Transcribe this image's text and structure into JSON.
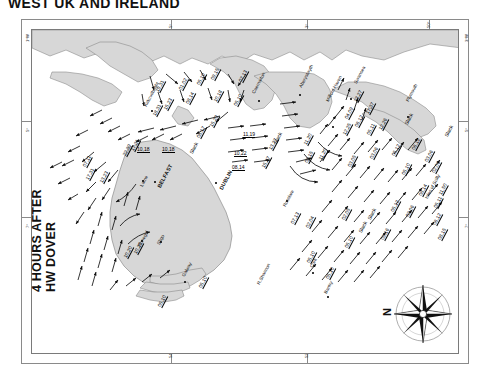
{
  "title": "WEST UK AND IRELAND",
  "caption_line1": "4 HOURS AFTER",
  "caption_line2": "HW DOVER",
  "compass": {
    "north_label": "N",
    "name": "compass-rose"
  },
  "frame": {
    "top_degrees": [
      "5°",
      "3°",
      "50°"
    ],
    "bottom_degrees": [
      "54°",
      "52°",
      "50°"
    ],
    "left_degrees": [
      "1°W",
      "5°",
      "7°",
      "4°"
    ],
    "right_degrees": [
      "3°W",
      "5°",
      "7°",
      "4°"
    ]
  },
  "places": [
    {
      "name": "Kirkcudbright",
      "x": 111,
      "y": 75,
      "rot": -62,
      "cap": false,
      "dot": [
        119,
        80
      ]
    },
    {
      "name": "Caernarfon",
      "x": 219,
      "y": 62,
      "rot": -62,
      "cap": false,
      "dot": [
        226,
        70
      ]
    },
    {
      "name": "Aberystwyth",
      "x": 266,
      "y": 56,
      "rot": -62,
      "cap": false,
      "dot": [
        267,
        64
      ]
    },
    {
      "name": "Milford Haven",
      "x": 293,
      "y": 70,
      "rot": -62,
      "cap": false,
      "dot": [
        300,
        96
      ]
    },
    {
      "name": "Swansea",
      "x": 321,
      "y": 52,
      "rot": -62,
      "cap": false,
      "dot": [
        318,
        68
      ]
    },
    {
      "name": "Plymouth",
      "x": 373,
      "y": 70,
      "rot": -62,
      "cap": false,
      "dot": [
        375,
        86
      ]
    },
    {
      "name": "Larne",
      "x": 107,
      "y": 155,
      "rot": -62,
      "cap": false,
      "dot": [
        110,
        150
      ]
    },
    {
      "name": "BELFAST",
      "x": 124,
      "y": 156,
      "rot": -62,
      "cap": true,
      "dot": [
        122,
        151
      ]
    },
    {
      "name": "DUBLIN",
      "x": 186,
      "y": 158,
      "rot": -62,
      "cap": true,
      "dot": [
        183,
        152
      ]
    },
    {
      "name": "Rosslare",
      "x": 250,
      "y": 175,
      "rot": -62,
      "cap": false,
      "dot": [
        254,
        170
      ]
    },
    {
      "name": "Donegal",
      "x": 105,
      "y": 215,
      "rot": -62,
      "cap": false,
      "dot": [
        109,
        210
      ]
    },
    {
      "name": "Sligo",
      "x": 124,
      "y": 213,
      "rot": -62,
      "cap": false,
      "dot": [
        128,
        211
      ]
    },
    {
      "name": "Galway",
      "x": 149,
      "y": 245,
      "rot": -62,
      "cap": false,
      "dot": [
        152,
        251
      ]
    },
    {
      "name": "R.Shannon",
      "x": 224,
      "y": 253,
      "rot": -62,
      "cap": false,
      "dot": null
    },
    {
      "name": "Cork",
      "x": 277,
      "y": 236,
      "rot": -62,
      "cap": false,
      "dot": [
        280,
        242
      ]
    },
    {
      "name": "Bantry",
      "x": 291,
      "y": 262,
      "rot": -62,
      "cap": false,
      "dot": [
        295,
        266
      ]
    },
    {
      "name": "Isles of Scilly",
      "x": 392,
      "y": 167,
      "rot": -62,
      "cap": false,
      "dot": null
    }
  ],
  "rates": [
    {
      "v": "19,31",
      "x": 122,
      "y": 60,
      "rot": -62
    },
    {
      "v": "01,02",
      "x": 145,
      "y": 58,
      "rot": -62
    },
    {
      "v": "05,10",
      "x": 163,
      "y": 53,
      "rot": -62
    },
    {
      "v": "09,15",
      "x": 177,
      "y": 48,
      "rot": -62
    },
    {
      "v": "07,13",
      "x": 205,
      "y": 50,
      "rot": -62
    },
    {
      "v": "18,31",
      "x": 119,
      "y": 84,
      "rot": -62
    },
    {
      "v": "15,23",
      "x": 130,
      "y": 78,
      "rot": -62
    },
    {
      "v": "08,14",
      "x": 152,
      "y": 72,
      "rot": -62
    },
    {
      "v": "10,18",
      "x": 180,
      "y": 70,
      "rot": -62
    },
    {
      "v": "05,10",
      "x": 200,
      "y": 74,
      "rot": -62
    },
    {
      "v": "15,29",
      "x": 176,
      "y": 95,
      "rot": -62
    },
    {
      "v": "08,17",
      "x": 163,
      "y": 106,
      "rot": -62
    },
    {
      "v": "22,39",
      "x": 89,
      "y": 124,
      "rot": -62
    },
    {
      "v": "17,31",
      "x": 97,
      "y": 119,
      "rot": -62
    },
    {
      "v": "10,18",
      "x": 105,
      "y": 116,
      "rot": 0
    },
    {
      "v": "10,18",
      "x": 130,
      "y": 116,
      "rot": 0
    },
    {
      "v": "17,31",
      "x": 52,
      "y": 148,
      "rot": -62
    },
    {
      "v": "13,23",
      "x": 66,
      "y": 151,
      "rot": -62
    },
    {
      "v": "07,11",
      "x": 49,
      "y": 135,
      "rot": -62
    },
    {
      "v": "11,19",
      "x": 211,
      "y": 101,
      "rot": 0
    },
    {
      "v": "10,22",
      "x": 202,
      "y": 120,
      "rot": 0
    },
    {
      "v": "08,14",
      "x": 200,
      "y": 134,
      "rot": 0
    },
    {
      "v": "15,37",
      "x": 228,
      "y": 136,
      "rot": -62
    },
    {
      "v": "13,27",
      "x": 235,
      "y": 118,
      "rot": -62
    },
    {
      "v": "13,27",
      "x": 320,
      "y": 70,
      "rot": -62
    },
    {
      "v": "17,37",
      "x": 332,
      "y": 82,
      "rot": -62
    },
    {
      "v": "04,09",
      "x": 311,
      "y": 87,
      "rot": -62
    },
    {
      "v": "06,12",
      "x": 321,
      "y": 95,
      "rot": -62
    },
    {
      "v": "12,25",
      "x": 309,
      "y": 103,
      "rot": -62
    },
    {
      "v": "05,11",
      "x": 333,
      "y": 103,
      "rot": -62
    },
    {
      "v": "12,26",
      "x": 345,
      "y": 98,
      "rot": -62
    },
    {
      "v": "08,15",
      "x": 271,
      "y": 131,
      "rot": -62
    },
    {
      "v": "11,20",
      "x": 285,
      "y": 128,
      "rot": -62
    },
    {
      "v": "03,05",
      "x": 314,
      "y": 135,
      "rot": -62
    },
    {
      "v": "03,06",
      "x": 336,
      "y": 127,
      "rot": -62
    },
    {
      "v": "05,12",
      "x": 358,
      "y": 124,
      "rot": -62
    },
    {
      "v": "05,10",
      "x": 368,
      "y": 143,
      "rot": -62
    },
    {
      "v": "06,12",
      "x": 378,
      "y": 118,
      "rot": -62
    },
    {
      "v": "03,06",
      "x": 391,
      "y": 130,
      "rot": -62
    },
    {
      "v": "02,06",
      "x": 398,
      "y": 141,
      "rot": -62
    },
    {
      "v": "08,14",
      "x": 385,
      "y": 164,
      "rot": -62
    },
    {
      "v": "11,50",
      "x": 405,
      "y": 163,
      "rot": -62
    },
    {
      "v": "05,11",
      "x": 400,
      "y": 176,
      "rot": -62
    },
    {
      "v": "06,12",
      "x": 399,
      "y": 193,
      "rot": -62
    },
    {
      "v": "03,06",
      "x": 372,
      "y": 185,
      "rot": -62
    },
    {
      "v": "05,12",
      "x": 357,
      "y": 180,
      "rot": -62
    },
    {
      "v": "08,15",
      "x": 404,
      "y": 208,
      "rot": -62
    },
    {
      "v": "07,13",
      "x": 257,
      "y": 192,
      "rot": -62
    },
    {
      "v": "02,04",
      "x": 272,
      "y": 196,
      "rot": -62
    },
    {
      "v": "02,05",
      "x": 308,
      "y": 188,
      "rot": -62
    },
    {
      "v": "05,10",
      "x": 311,
      "y": 216,
      "rot": -62
    },
    {
      "v": "05,10",
      "x": 292,
      "y": 247,
      "rot": -62
    },
    {
      "v": "05,10",
      "x": 273,
      "y": 231,
      "rot": -62
    },
    {
      "v": "05,10",
      "x": 165,
      "y": 256,
      "rot": -62
    },
    {
      "v": "05,10",
      "x": 124,
      "y": 275,
      "rot": -62
    },
    {
      "v": "10,20",
      "x": 90,
      "y": 226,
      "rot": -62
    },
    {
      "v": "10,20",
      "x": 100,
      "y": 222,
      "rot": -62
    },
    {
      "v": "11,20",
      "x": 270,
      "y": 113,
      "rot": -62
    },
    {
      "v": "09,16",
      "x": 347,
      "y": 208,
      "rot": -62
    }
  ],
  "slacks": [
    {
      "v": "Slack",
      "x": 156,
      "y": 122,
      "rot": -62
    },
    {
      "v": "Slack",
      "x": 240,
      "y": 112,
      "rot": -62
    },
    {
      "v": "Slack",
      "x": 371,
      "y": 93,
      "rot": -62
    },
    {
      "v": "Slack",
      "x": 411,
      "y": 105,
      "rot": -62
    },
    {
      "v": "Slack",
      "x": 334,
      "y": 188,
      "rot": -62
    },
    {
      "v": "Slack",
      "x": 325,
      "y": 201,
      "rot": -62
    }
  ]
}
